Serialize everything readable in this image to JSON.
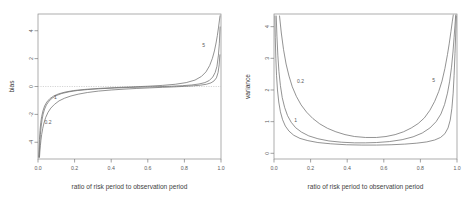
{
  "figure": {
    "background": "#ffffff",
    "line_color": "#6f6f6f",
    "axis_color": "#7a7a7a",
    "text_color": "#4a4a4a",
    "panel_count": 2
  },
  "chart_data": [
    {
      "type": "line",
      "panel": "left",
      "title": "",
      "xlabel": "ratio of risk period to observation period",
      "ylabel": "bias",
      "xlim": [
        0.0,
        1.0
      ],
      "ylim": [
        -5.2,
        5.2
      ],
      "xticks": [
        0.0,
        0.2,
        0.4,
        0.6,
        0.8,
        1.0
      ],
      "xticklabels": [
        "0.0",
        "0.2",
        "0.4",
        "0.6",
        "0.8",
        "1.0"
      ],
      "yticks": [
        -4,
        -2,
        0,
        2,
        4
      ],
      "yticklabels": [
        "-4",
        "-2",
        "0",
        "2",
        "4"
      ],
      "grid": false,
      "legend": "inline-curve-labels",
      "zero_reference_line": true,
      "series": [
        {
          "name": "0.2",
          "label": "0.2",
          "label_x": 0.055,
          "label_y": -2.55,
          "x": [
            0.008,
            0.01,
            0.013,
            0.016,
            0.02,
            0.026,
            0.033,
            0.042,
            0.055,
            0.07,
            0.09,
            0.115,
            0.145,
            0.18,
            0.22,
            0.27,
            0.33,
            0.4,
            0.47,
            0.54,
            0.61,
            0.68,
            0.74,
            0.8,
            0.85,
            0.89,
            0.92,
            0.945,
            0.962,
            0.975,
            0.984,
            0.99,
            0.994
          ],
          "y": [
            -5.1,
            -4.7,
            -4.25,
            -3.85,
            -3.45,
            -3.0,
            -2.6,
            -2.22,
            -1.85,
            -1.55,
            -1.28,
            -1.03,
            -0.84,
            -0.68,
            -0.55,
            -0.43,
            -0.33,
            -0.25,
            -0.19,
            -0.14,
            -0.1,
            -0.06,
            -0.03,
            0.01,
            0.05,
            0.1,
            0.16,
            0.26,
            0.4,
            0.62,
            1.0,
            1.55,
            2.3
          ]
        },
        {
          "name": "1",
          "label": "1",
          "label_x": 0.095,
          "label_y": -0.72,
          "x": [
            0.006,
            0.008,
            0.01,
            0.013,
            0.017,
            0.022,
            0.028,
            0.036,
            0.046,
            0.06,
            0.078,
            0.1,
            0.13,
            0.17,
            0.215,
            0.27,
            0.34,
            0.42,
            0.5,
            0.58,
            0.66,
            0.73,
            0.79,
            0.84,
            0.88,
            0.912,
            0.936,
            0.955,
            0.968,
            0.978,
            0.986,
            0.991,
            0.995
          ],
          "y": [
            -5.1,
            -4.55,
            -4.05,
            -3.45,
            -2.9,
            -2.4,
            -1.98,
            -1.62,
            -1.32,
            -1.05,
            -0.83,
            -0.65,
            -0.5,
            -0.38,
            -0.29,
            -0.22,
            -0.16,
            -0.11,
            -0.07,
            -0.04,
            -0.01,
            0.02,
            0.06,
            0.11,
            0.18,
            0.28,
            0.43,
            0.68,
            1.0,
            1.45,
            2.25,
            3.1,
            4.3
          ]
        },
        {
          "name": "5",
          "label": "5",
          "label_x": 0.905,
          "label_y": 2.95,
          "x": [
            0.004,
            0.006,
            0.008,
            0.011,
            0.015,
            0.02,
            0.027,
            0.036,
            0.048,
            0.064,
            0.085,
            0.112,
            0.148,
            0.195,
            0.255,
            0.33,
            0.42,
            0.51,
            0.6,
            0.68,
            0.75,
            0.81,
            0.858,
            0.893,
            0.918,
            0.938,
            0.953,
            0.964,
            0.973,
            0.98,
            0.986,
            0.991,
            0.995
          ],
          "y": [
            -5.1,
            -4.4,
            -3.8,
            -3.15,
            -2.6,
            -2.15,
            -1.75,
            -1.4,
            -1.12,
            -0.88,
            -0.69,
            -0.53,
            -0.4,
            -0.29,
            -0.21,
            -0.14,
            -0.08,
            -0.03,
            0.02,
            0.08,
            0.16,
            0.28,
            0.46,
            0.72,
            1.05,
            1.5,
            2.02,
            2.55,
            3.12,
            3.65,
            4.2,
            4.7,
            5.1
          ]
        }
      ]
    },
    {
      "type": "line",
      "panel": "right",
      "title": "",
      "xlabel": "ratio of risk period to observation period",
      "ylabel": "variance",
      "xlim": [
        0.0,
        1.0
      ],
      "ylim": [
        -0.18,
        4.4
      ],
      "xticks": [
        0.0,
        0.2,
        0.4,
        0.6,
        0.8,
        1.0
      ],
      "xticklabels": [
        "0.0",
        "0.2",
        "0.4",
        "0.6",
        "0.8",
        "1.0"
      ],
      "yticks": [
        0,
        1,
        2,
        3,
        4
      ],
      "yticklabels": [
        "0",
        "1",
        "2",
        "3",
        "4"
      ],
      "grid": false,
      "legend": "inline-curve-labels",
      "zero_reference_line": false,
      "series": [
        {
          "name": "0.2",
          "label": "0.2",
          "label_x": 0.145,
          "label_y": 2.28,
          "x": [
            0.03,
            0.04,
            0.052,
            0.066,
            0.082,
            0.1,
            0.122,
            0.148,
            0.178,
            0.212,
            0.25,
            0.292,
            0.338,
            0.388,
            0.44,
            0.5,
            0.56,
            0.612,
            0.662,
            0.708,
            0.75,
            0.788,
            0.822,
            0.852,
            0.878,
            0.9,
            0.918,
            0.934,
            0.948,
            0.958,
            0.967,
            0.974,
            0.98
          ],
          "y": [
            4.35,
            3.8,
            3.28,
            2.82,
            2.44,
            2.1,
            1.8,
            1.53,
            1.3,
            1.1,
            0.93,
            0.79,
            0.68,
            0.59,
            0.53,
            0.5,
            0.5,
            0.53,
            0.59,
            0.68,
            0.8,
            0.94,
            1.12,
            1.36,
            1.64,
            1.95,
            2.28,
            2.68,
            3.12,
            3.48,
            3.85,
            4.15,
            4.38
          ]
        },
        {
          "name": "1",
          "label": "1",
          "label_x": 0.118,
          "label_y": 1.06,
          "x": [
            0.012,
            0.016,
            0.021,
            0.027,
            0.035,
            0.045,
            0.058,
            0.074,
            0.094,
            0.118,
            0.15,
            0.19,
            0.24,
            0.3,
            0.37,
            0.44,
            0.5,
            0.56,
            0.63,
            0.7,
            0.76,
            0.81,
            0.852,
            0.886,
            0.912,
            0.932,
            0.948,
            0.96,
            0.97,
            0.978,
            0.984,
            0.989,
            0.993
          ],
          "y": [
            4.35,
            3.7,
            3.1,
            2.58,
            2.14,
            1.76,
            1.45,
            1.19,
            0.98,
            0.81,
            0.67,
            0.55,
            0.46,
            0.39,
            0.35,
            0.33,
            0.33,
            0.34,
            0.37,
            0.43,
            0.52,
            0.64,
            0.8,
            1.0,
            1.24,
            1.54,
            1.9,
            2.28,
            2.72,
            3.2,
            3.65,
            4.05,
            4.38
          ]
        },
        {
          "name": "5",
          "label": "5",
          "label_x": 0.873,
          "label_y": 2.3,
          "x": [
            0.005,
            0.007,
            0.01,
            0.014,
            0.019,
            0.026,
            0.035,
            0.047,
            0.062,
            0.082,
            0.108,
            0.142,
            0.185,
            0.24,
            0.31,
            0.395,
            0.48,
            0.56,
            0.64,
            0.715,
            0.78,
            0.835,
            0.878,
            0.91,
            0.934,
            0.951,
            0.963,
            0.972,
            0.979,
            0.984,
            0.989,
            0.993,
            0.996
          ],
          "y": [
            4.35,
            3.65,
            3.0,
            2.45,
            2.0,
            1.62,
            1.31,
            1.06,
            0.86,
            0.7,
            0.57,
            0.47,
            0.4,
            0.34,
            0.3,
            0.27,
            0.26,
            0.26,
            0.27,
            0.29,
            0.32,
            0.36,
            0.42,
            0.5,
            0.62,
            0.8,
            1.05,
            1.42,
            1.9,
            2.45,
            3.15,
            3.8,
            4.35
          ]
        }
      ]
    }
  ]
}
